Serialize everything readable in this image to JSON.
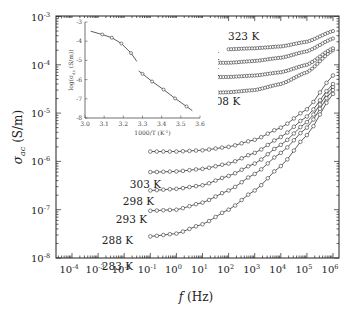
{
  "chart_data": [
    {
      "type": "scatter",
      "title": "",
      "xlabel": "f (Hz)",
      "ylabel": "σ_ac (S/m)",
      "xscale": "log",
      "yscale": "log",
      "xlim": [
        5e-05,
        1500000
      ],
      "ylim": [
        1e-08,
        0.001
      ],
      "x_ticks": [
        "10^-4",
        "10^-3",
        "10^-2",
        "10^-1",
        "10^0",
        "10^1",
        "10^2",
        "10^3",
        "10^4",
        "10^5",
        "10^6"
      ],
      "y_ticks": [
        "10^-8",
        "10^-7",
        "10^-6",
        "10^-5",
        "10^-4",
        "10^-3"
      ],
      "grid": false,
      "legend": "none (curves labeled inline with temperatures)",
      "marker": "open circle with fitted line",
      "series": [
        {
          "name": "283 K",
          "x": [
            0.1,
            1,
            10,
            100,
            1000,
            10000,
            100000,
            1000000
          ],
          "y": [
            2.8e-08,
            3.2e-08,
            5e-08,
            1e-07,
            2.5e-07,
            8e-07,
            3.5e-06,
            2.5e-05
          ]
        },
        {
          "name": "288 K",
          "x": [
            0.1,
            1,
            10,
            100,
            1000,
            10000,
            100000,
            1000000
          ],
          "y": [
            9.5e-08,
            1e-07,
            1.4e-07,
            2.5e-07,
            5.5e-07,
            1.5e-06,
            5e-06,
            3e-05
          ]
        },
        {
          "name": "293 K",
          "x": [
            0.1,
            1,
            10,
            100,
            1000,
            10000,
            100000,
            1000000
          ],
          "y": [
            2.5e-07,
            2.7e-07,
            3.2e-07,
            5e-07,
            9e-07,
            2.2e-06,
            6.5e-06,
            3.5e-05
          ]
        },
        {
          "name": "298 K",
          "x": [
            0.1,
            1,
            10,
            100,
            1000,
            10000,
            100000,
            1000000
          ],
          "y": [
            6e-07,
            6.2e-07,
            7e-07,
            9e-07,
            1.5e-06,
            3.2e-06,
            8.5e-06,
            4e-05
          ]
        },
        {
          "name": "303 K",
          "x": [
            0.1,
            1,
            10,
            100,
            1000,
            10000,
            100000,
            1000000
          ],
          "y": [
            1.6e-06,
            1.6e-06,
            1.7e-06,
            2e-06,
            2.8e-06,
            5e-06,
            1.2e-05,
            6e-05
          ]
        },
        {
          "name": "308 K",
          "x": [
            10,
            100,
            1000,
            10000,
            100000,
            1000000
          ],
          "y": [
            2.6e-05,
            2.7e-05,
            3e-05,
            4e-05,
            7e-05,
            0.0002
          ]
        },
        {
          "name": "313 K",
          "x": [
            10,
            100,
            1000,
            10000,
            100000,
            1000000
          ],
          "y": [
            5.5e-05,
            5.6e-05,
            6e-05,
            7e-05,
            0.0001,
            0.00022
          ]
        },
        {
          "name": "318 K",
          "x": [
            10,
            100,
            1000,
            10000,
            100000,
            1000000
          ],
          "y": [
            0.00011,
            0.00011,
            0.00012,
            0.00014,
            0.00019,
            0.00035
          ]
        },
        {
          "name": "323 K",
          "x": [
            100,
            1000,
            10000,
            100000,
            1000000
          ],
          "y": [
            0.00021,
            0.00022,
            0.00024,
            0.0003,
            0.0005
          ]
        }
      ]
    },
    {
      "type": "line",
      "title": "inset",
      "xlabel": "1000/T (K^-1)",
      "ylabel": "log(σ_dc (S/m))",
      "xlim": [
        3.0,
        3.6
      ],
      "ylim": [
        -8,
        -3
      ],
      "x_ticks": [
        "3.0",
        "3.1",
        "3.2",
        "3.3",
        "3.4",
        "3.5",
        "3.6"
      ],
      "y_ticks": [
        "-3",
        "-4",
        "-5",
        "-6",
        "-7",
        "-8"
      ],
      "series": [
        {
          "name": "high-T fit",
          "x": [
            3.09,
            3.14,
            3.19,
            3.24
          ],
          "y": [
            -3.65,
            -3.82,
            -4.12,
            -4.62
          ]
        },
        {
          "name": "low-T fit",
          "x": [
            3.3,
            3.35,
            3.41,
            3.47,
            3.53
          ],
          "y": [
            -5.7,
            -6.1,
            -6.52,
            -6.98,
            -7.4
          ]
        }
      ]
    }
  ],
  "labels": {
    "x_axis": "f",
    "x_unit": "(Hz)",
    "y_axis": "σ",
    "y_sub": "ac",
    "y_unit": "(S/m)",
    "inset_x_title": "1000/T (K",
    "inset_x_sup": "-1",
    "inset_y_title": "log(σ",
    "inset_y_sub": "dc",
    "inset_y_unit": " (S/m))"
  }
}
